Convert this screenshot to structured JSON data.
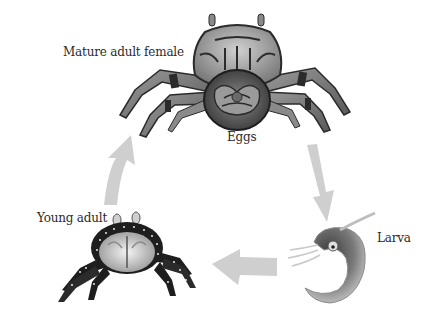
{
  "diagram": {
    "type": "life-cycle",
    "stages": [
      {
        "id": "mature",
        "label": "Mature adult female"
      },
      {
        "id": "eggs",
        "label": "Eggs"
      },
      {
        "id": "larva",
        "label": "Larva"
      },
      {
        "id": "young",
        "label": "Young adult"
      }
    ],
    "arrows": [
      {
        "from": "eggs",
        "to": "larva"
      },
      {
        "from": "larva",
        "to": "young"
      },
      {
        "from": "young",
        "to": "mature"
      }
    ],
    "colors": {
      "arrow": "#cfcfcf",
      "crab_light": "#b5b5b5",
      "crab_dark": "#2b2b2b",
      "young_crab_body": "#1e1e1e",
      "larva_body": "#6a6a6a"
    }
  }
}
